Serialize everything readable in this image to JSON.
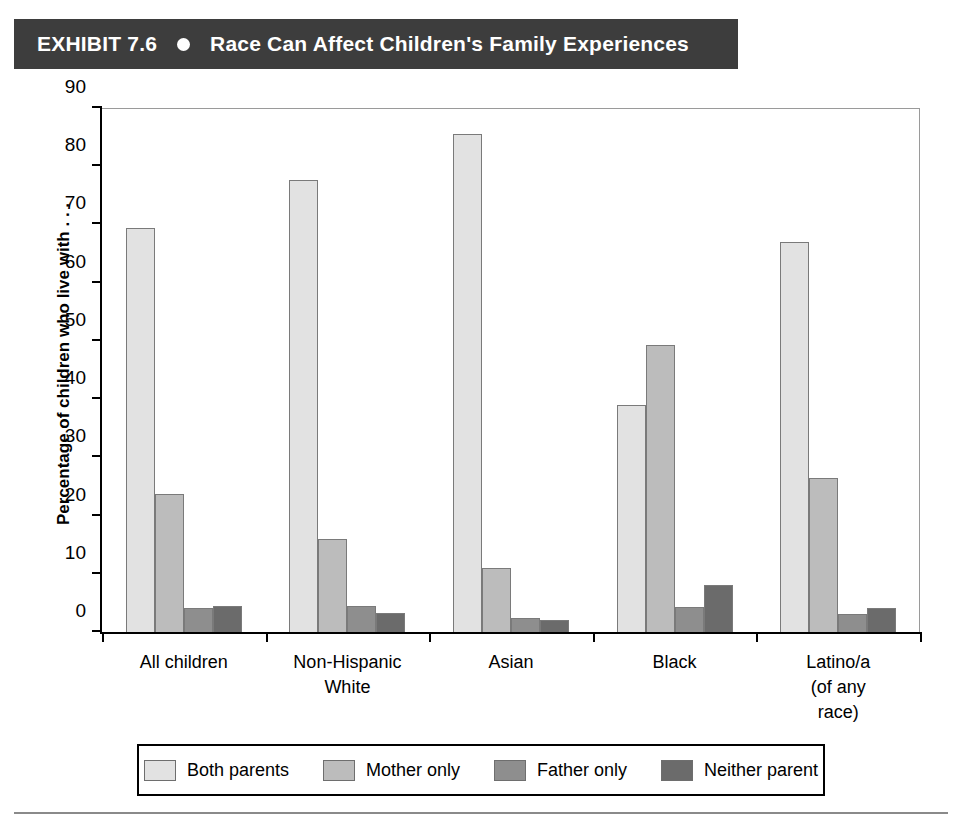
{
  "header": {
    "exhibit_number": "EXHIBIT 7.6",
    "bullet_icon": "circle-bullet-icon",
    "title": "Race Can Affect Children's Family Experiences",
    "background_color": "#3d3d3d",
    "text_color": "#ffffff"
  },
  "chart_data": {
    "type": "bar",
    "title": "Race Can Affect Children's Family Experiences",
    "xlabel": "",
    "ylabel": "Percentage of children who live with . . .",
    "ylim": [
      0,
      90
    ],
    "ytick_step": 10,
    "ytick_labels": [
      "0",
      "10",
      "20",
      "30",
      "40",
      "50",
      "60",
      "70",
      "80",
      "90"
    ],
    "grid": false,
    "legend_position": "bottom",
    "categories": [
      "All children",
      "Non-Hispanic\nWhite",
      "Asian",
      "Black",
      "Latino/a\n(of any\nrace)"
    ],
    "series": [
      {
        "name": "Both parents",
        "color": "#e2e2e2",
        "values": [
          69.4,
          77.6,
          85.5,
          39.0,
          67.0
        ]
      },
      {
        "name": "Mother only",
        "color": "#bcbcbc",
        "values": [
          23.7,
          15.9,
          11.0,
          49.3,
          26.4
        ]
      },
      {
        "name": "Father only",
        "color": "#8e8e8e",
        "values": [
          4.1,
          4.4,
          2.4,
          4.3,
          3.1
        ]
      },
      {
        "name": "Neither parent",
        "color": "#6b6b6b",
        "values": [
          4.4,
          3.2,
          2.0,
          8.1,
          4.2
        ]
      }
    ]
  }
}
